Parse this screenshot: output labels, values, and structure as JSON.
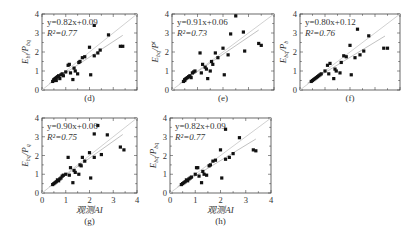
{
  "chart_data": [
    {
      "type": "scatter",
      "panel_label": "(d)",
      "ylabel": "E_bi/P_bq",
      "xlabel": "",
      "equation": "y=0.82x+0.09",
      "r2": "R²=0.77",
      "xlim": [
        0,
        4
      ],
      "ylim": [
        0,
        4
      ],
      "xticks": [],
      "yticks": [
        0,
        1,
        2,
        3,
        4
      ],
      "fit": {
        "slope": 0.82,
        "intercept": 0.09
      },
      "points": [
        [
          0.45,
          0.45
        ],
        [
          0.5,
          0.5
        ],
        [
          0.5,
          0.55
        ],
        [
          0.55,
          0.6
        ],
        [
          0.6,
          0.65
        ],
        [
          0.6,
          0.5
        ],
        [
          0.65,
          0.7
        ],
        [
          0.7,
          0.75
        ],
        [
          0.75,
          0.6
        ],
        [
          0.8,
          0.8
        ],
        [
          0.85,
          0.85
        ],
        [
          0.9,
          0.75
        ],
        [
          1.0,
          0.95
        ],
        [
          1.1,
          1.3
        ],
        [
          1.15,
          1.35
        ],
        [
          1.2,
          0.9
        ],
        [
          1.3,
          0.55
        ],
        [
          1.35,
          1.15
        ],
        [
          1.4,
          1.0
        ],
        [
          1.5,
          0.85
        ],
        [
          1.55,
          1.45
        ],
        [
          1.6,
          1.5
        ],
        [
          1.7,
          1.7
        ],
        [
          1.8,
          1.75
        ],
        [
          2.0,
          2.25
        ],
        [
          2.05,
          0.8
        ],
        [
          2.2,
          1.8
        ],
        [
          2.35,
          1.95
        ],
        [
          2.45,
          2.1
        ],
        [
          2.2,
          3.4
        ],
        [
          2.8,
          2.9
        ],
        [
          3.3,
          2.3
        ],
        [
          3.4,
          2.3
        ]
      ]
    },
    {
      "type": "scatter",
      "panel_label": "(e)",
      "ylabel": "E_bq/P^t",
      "xlabel": "",
      "equation": "y=0.91x+0.06",
      "r2": "R²=0.73",
      "xlim": [
        0,
        4
      ],
      "ylim": [
        0,
        4
      ],
      "xticks": [],
      "yticks": [
        0,
        1,
        2,
        3,
        4
      ],
      "fit": {
        "slope": 0.91,
        "intercept": 0.06
      },
      "points": [
        [
          0.45,
          0.45
        ],
        [
          0.5,
          0.5
        ],
        [
          0.5,
          0.55
        ],
        [
          0.55,
          0.6
        ],
        [
          0.6,
          0.65
        ],
        [
          0.65,
          0.7
        ],
        [
          0.7,
          0.75
        ],
        [
          0.75,
          0.65
        ],
        [
          0.8,
          0.9
        ],
        [
          0.85,
          0.95
        ],
        [
          0.9,
          1.0
        ],
        [
          1.1,
          1.95
        ],
        [
          1.15,
          0.9
        ],
        [
          1.2,
          1.35
        ],
        [
          1.3,
          1.2
        ],
        [
          1.35,
          1.1
        ],
        [
          1.4,
          0.6
        ],
        [
          1.5,
          1.0
        ],
        [
          1.55,
          1.5
        ],
        [
          1.6,
          1.35
        ],
        [
          1.7,
          1.95
        ],
        [
          1.8,
          1.7
        ],
        [
          2.0,
          2.2
        ],
        [
          2.05,
          0.8
        ],
        [
          2.2,
          1.85
        ],
        [
          2.3,
          2.95
        ],
        [
          2.5,
          3.9
        ],
        [
          2.8,
          3.05
        ],
        [
          2.85,
          2.05
        ],
        [
          3.4,
          2.45
        ],
        [
          3.5,
          2.35
        ]
      ]
    },
    {
      "type": "scatter",
      "panel_label": "(f)",
      "ylabel": "E_bq/P_b",
      "xlabel": "",
      "equation": "y=0.80x+0.12",
      "r2": "R²=0.76",
      "xlim": [
        0,
        4
      ],
      "ylim": [
        0,
        4
      ],
      "xticks": [],
      "yticks": [
        0,
        1,
        2,
        3,
        4
      ],
      "fit": {
        "slope": 0.8,
        "intercept": 0.12
      },
      "points": [
        [
          0.45,
          0.45
        ],
        [
          0.5,
          0.5
        ],
        [
          0.55,
          0.55
        ],
        [
          0.6,
          0.6
        ],
        [
          0.65,
          0.65
        ],
        [
          0.7,
          0.7
        ],
        [
          0.75,
          0.75
        ],
        [
          0.8,
          0.8
        ],
        [
          0.85,
          0.85
        ],
        [
          1.0,
          1.0
        ],
        [
          1.1,
          1.3
        ],
        [
          1.15,
          0.85
        ],
        [
          1.2,
          1.4
        ],
        [
          1.35,
          0.6
        ],
        [
          1.4,
          1.1
        ],
        [
          1.45,
          1.0
        ],
        [
          1.6,
          0.9
        ],
        [
          1.65,
          1.45
        ],
        [
          1.75,
          1.8
        ],
        [
          1.85,
          1.75
        ],
        [
          2.0,
          2.35
        ],
        [
          2.05,
          0.8
        ],
        [
          2.2,
          1.7
        ],
        [
          2.3,
          3.2
        ],
        [
          2.4,
          1.85
        ],
        [
          2.55,
          2.05
        ],
        [
          2.75,
          2.85
        ],
        [
          3.35,
          2.2
        ],
        [
          3.5,
          2.2
        ]
      ]
    },
    {
      "type": "scatter",
      "panel_label": "(g)",
      "ylabel": "E_bq/P_q",
      "xlabel": "观测AI",
      "equation": "y=0.90x+0.06",
      "r2": "R²=0.75",
      "xlim": [
        0,
        4
      ],
      "ylim": [
        0,
        4
      ],
      "xticks": [
        0,
        1,
        2,
        3,
        4
      ],
      "yticks": [
        0,
        1,
        2,
        3,
        4
      ],
      "fit": {
        "slope": 0.9,
        "intercept": 0.06
      },
      "points": [
        [
          0.45,
          0.45
        ],
        [
          0.5,
          0.5
        ],
        [
          0.55,
          0.55
        ],
        [
          0.6,
          0.6
        ],
        [
          0.65,
          0.7
        ],
        [
          0.7,
          0.65
        ],
        [
          0.75,
          0.75
        ],
        [
          0.8,
          0.8
        ],
        [
          0.85,
          0.9
        ],
        [
          0.9,
          0.95
        ],
        [
          1.0,
          1.0
        ],
        [
          1.1,
          1.9
        ],
        [
          1.15,
          0.95
        ],
        [
          1.2,
          1.35
        ],
        [
          1.3,
          0.55
        ],
        [
          1.35,
          1.2
        ],
        [
          1.4,
          1.1
        ],
        [
          1.55,
          1.0
        ],
        [
          1.6,
          1.5
        ],
        [
          1.65,
          1.45
        ],
        [
          1.7,
          1.9
        ],
        [
          1.8,
          1.7
        ],
        [
          2.0,
          2.15
        ],
        [
          2.05,
          0.8
        ],
        [
          2.2,
          1.9
        ],
        [
          2.2,
          3.15
        ],
        [
          2.35,
          3.6
        ],
        [
          2.5,
          2.05
        ],
        [
          2.75,
          3.1
        ],
        [
          3.3,
          2.45
        ],
        [
          3.45,
          2.3
        ]
      ]
    },
    {
      "type": "scatter",
      "panel_label": "(h)",
      "ylabel": "E_bq/P_bq",
      "xlabel": "观测AI",
      "equation": "y=0.82x+0.09",
      "r2": "R²=0.77",
      "xlim": [
        0,
        4
      ],
      "ylim": [
        0,
        4
      ],
      "xticks": [
        0,
        1,
        2,
        3,
        4
      ],
      "yticks": [
        0,
        1,
        2,
        3,
        4
      ],
      "fit": {
        "slope": 0.82,
        "intercept": 0.09
      },
      "points": [
        [
          0.45,
          0.45
        ],
        [
          0.5,
          0.5
        ],
        [
          0.55,
          0.55
        ],
        [
          0.6,
          0.6
        ],
        [
          0.65,
          0.7
        ],
        [
          0.7,
          0.65
        ],
        [
          0.75,
          0.75
        ],
        [
          0.8,
          0.8
        ],
        [
          0.85,
          0.85
        ],
        [
          1.0,
          1.0
        ],
        [
          1.05,
          1.35
        ],
        [
          1.1,
          1.35
        ],
        [
          1.15,
          0.9
        ],
        [
          1.25,
          0.55
        ],
        [
          1.3,
          1.15
        ],
        [
          1.35,
          1.0
        ],
        [
          1.45,
          0.95
        ],
        [
          1.55,
          1.45
        ],
        [
          1.6,
          1.5
        ],
        [
          1.7,
          1.7
        ],
        [
          1.8,
          1.75
        ],
        [
          2.0,
          2.3
        ],
        [
          2.05,
          0.8
        ],
        [
          2.2,
          1.8
        ],
        [
          2.2,
          3.4
        ],
        [
          2.35,
          1.9
        ],
        [
          2.5,
          2.1
        ],
        [
          2.75,
          2.95
        ],
        [
          3.3,
          2.3
        ],
        [
          3.4,
          2.25
        ]
      ]
    }
  ]
}
